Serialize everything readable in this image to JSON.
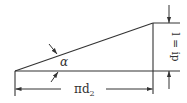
{
  "diagram": {
    "type": "thread-lead-angle-triangle",
    "colors": {
      "line": "#333333",
      "background": "#ffffff"
    },
    "labels": {
      "angle": "α",
      "base_pi": "πd",
      "base_sub": "2",
      "height": "l = ip"
    }
  }
}
